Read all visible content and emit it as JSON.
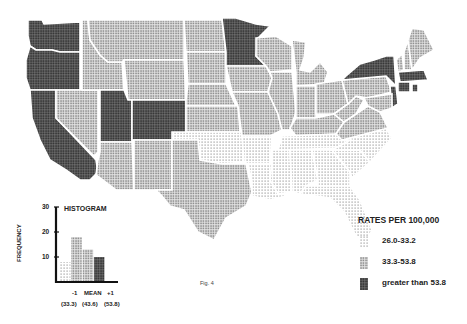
{
  "figure_label": "Fig. 4",
  "legend": {
    "title": "RATES PER 100,000",
    "items": [
      {
        "label": "26.0-33.2",
        "pattern": "light",
        "color": "#b8b8b8"
      },
      {
        "label": "33.3-53.8",
        "pattern": "medium",
        "color": "#8a8a8a"
      },
      {
        "label": "greater than 53.8",
        "pattern": "dark",
        "color": "#333333"
      }
    ]
  },
  "histogram": {
    "title": "HISTOGRAM",
    "ylabel": "FREQUENCY",
    "yticks": [
      "30",
      "20",
      "10"
    ],
    "xlabels": [
      "-1",
      "MEAN",
      "+1"
    ],
    "xvalues": [
      "(33.3)",
      "(43.6)",
      "(53.8)"
    ],
    "bars": [
      {
        "value": 8,
        "pattern": "light"
      },
      {
        "value": 18,
        "pattern": "medium"
      },
      {
        "value": 13,
        "pattern": "medium"
      },
      {
        "value": 10,
        "pattern": "dark"
      }
    ],
    "ylim": [
      0,
      30
    ]
  },
  "states": [
    {
      "name": "Washington",
      "class": "dark"
    },
    {
      "name": "Oregon",
      "class": "dark"
    },
    {
      "name": "California",
      "class": "dark"
    },
    {
      "name": "Nevada",
      "class": "medium"
    },
    {
      "name": "Idaho",
      "class": "medium"
    },
    {
      "name": "Montana",
      "class": "medium"
    },
    {
      "name": "Wyoming",
      "class": "medium"
    },
    {
      "name": "Utah",
      "class": "dark"
    },
    {
      "name": "Colorado",
      "class": "dark"
    },
    {
      "name": "Arizona",
      "class": "medium"
    },
    {
      "name": "New Mexico",
      "class": "medium"
    },
    {
      "name": "North Dakota",
      "class": "medium"
    },
    {
      "name": "South Dakota",
      "class": "medium"
    },
    {
      "name": "Nebraska",
      "class": "medium"
    },
    {
      "name": "Kansas",
      "class": "medium"
    },
    {
      "name": "Oklahoma",
      "class": "light"
    },
    {
      "name": "Texas",
      "class": "medium"
    },
    {
      "name": "Minnesota",
      "class": "dark"
    },
    {
      "name": "Iowa",
      "class": "medium"
    },
    {
      "name": "Missouri",
      "class": "medium"
    },
    {
      "name": "Arkansas",
      "class": "light"
    },
    {
      "name": "Louisiana",
      "class": "light"
    },
    {
      "name": "Wisconsin",
      "class": "medium"
    },
    {
      "name": "Illinois",
      "class": "medium"
    },
    {
      "name": "Michigan",
      "class": "medium"
    },
    {
      "name": "Indiana",
      "class": "medium"
    },
    {
      "name": "Ohio",
      "class": "medium"
    },
    {
      "name": "Kentucky",
      "class": "medium"
    },
    {
      "name": "Tennessee",
      "class": "light"
    },
    {
      "name": "Mississippi",
      "class": "light"
    },
    {
      "name": "Alabama",
      "class": "light"
    },
    {
      "name": "Georgia",
      "class": "light"
    },
    {
      "name": "Florida",
      "class": "light"
    },
    {
      "name": "South Carolina",
      "class": "light"
    },
    {
      "name": "North Carolina",
      "class": "light"
    },
    {
      "name": "Virginia",
      "class": "medium"
    },
    {
      "name": "West Virginia",
      "class": "medium"
    },
    {
      "name": "Pennsylvania",
      "class": "medium"
    },
    {
      "name": "New York",
      "class": "dark"
    },
    {
      "name": "New Jersey",
      "class": "dark"
    },
    {
      "name": "Maryland",
      "class": "medium"
    },
    {
      "name": "Vermont",
      "class": "medium"
    },
    {
      "name": "New Hampshire",
      "class": "medium"
    },
    {
      "name": "Maine",
      "class": "medium"
    },
    {
      "name": "Massachusetts",
      "class": "dark"
    },
    {
      "name": "Connecticut",
      "class": "dark"
    },
    {
      "name": "Rhode Island",
      "class": "dark"
    }
  ]
}
